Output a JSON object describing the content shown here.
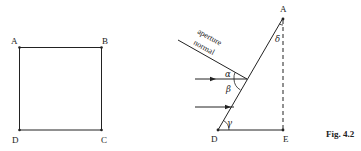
{
  "figure": {
    "caption": "Fig. 4.2",
    "left_diagram": {
      "shape": "square",
      "vertices": {
        "A": "A",
        "B": "B",
        "C": "C",
        "D": "D"
      }
    },
    "right_diagram": {
      "vertices": {
        "A": "A",
        "D": "D",
        "E": "E"
      },
      "line_label_1": "aperture",
      "line_label_2": "normal",
      "angles": {
        "alpha": "α",
        "beta": "β",
        "gamma": "γ",
        "delta": "δ"
      },
      "arrows_count": 2
    }
  }
}
